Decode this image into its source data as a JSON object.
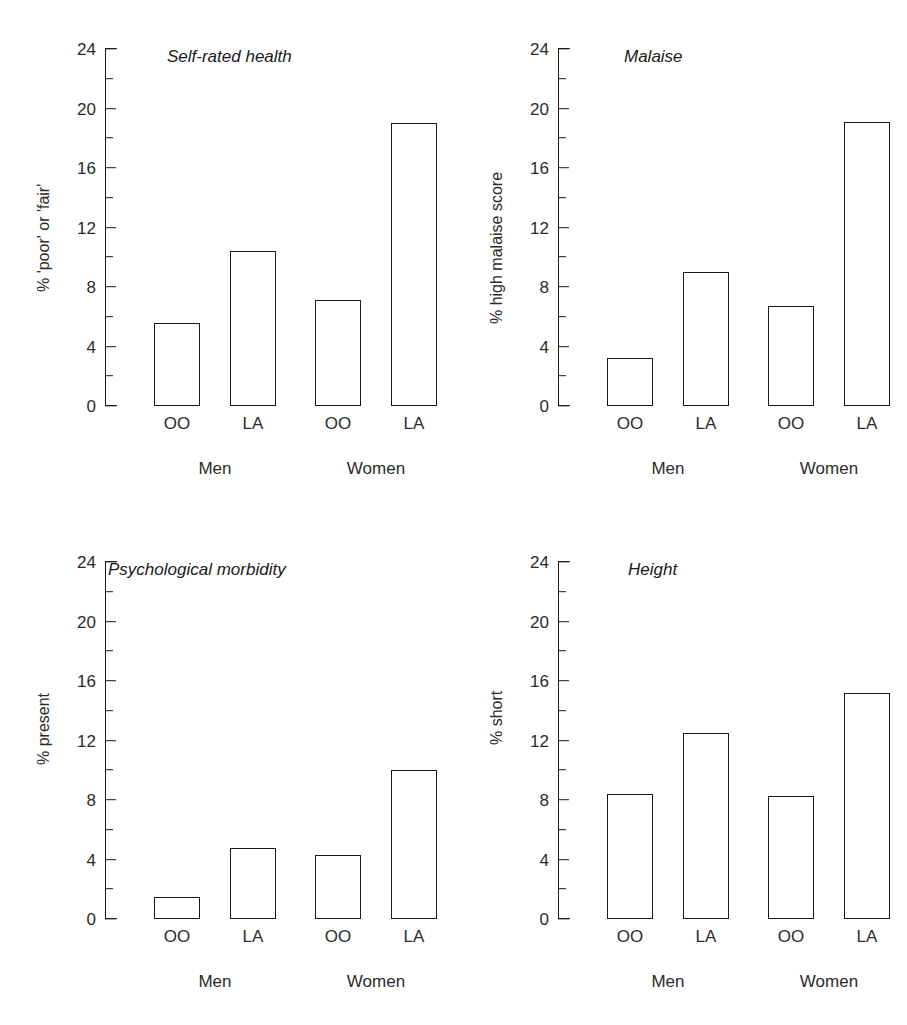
{
  "chart_data": [
    {
      "type": "bar",
      "title": "Self-rated health",
      "ylabel": "% 'poor' or 'fair'",
      "xlabel": "",
      "ylim": [
        0,
        24
      ],
      "yticks": [
        0,
        4,
        8,
        12,
        16,
        20,
        24
      ],
      "ytick_labels": [
        "0",
        "4",
        "8",
        "12",
        "16",
        "20",
        "24"
      ],
      "yticks_minor": [
        2,
        6,
        10,
        14,
        18,
        22
      ],
      "grid": false,
      "legend": "none",
      "groups": [
        "Men",
        "Women"
      ],
      "categories": [
        "OO",
        "LA"
      ],
      "bars": [
        {
          "group": "Men",
          "category": "OO",
          "value": 5.6
        },
        {
          "group": "Men",
          "category": "LA",
          "value": 10.4
        },
        {
          "group": "Women",
          "category": "OO",
          "value": 7.1
        },
        {
          "group": "Women",
          "category": "LA",
          "value": 19.0
        }
      ]
    },
    {
      "type": "bar",
      "title": "Malaise",
      "ylabel": "% high malaise score",
      "xlabel": "",
      "ylim": [
        0,
        24
      ],
      "yticks": [
        0,
        4,
        8,
        12,
        16,
        20,
        24
      ],
      "ytick_labels": [
        "0",
        "4",
        "8",
        "12",
        "16",
        "20",
        "24"
      ],
      "yticks_minor": [
        2,
        6,
        10,
        14,
        18,
        22
      ],
      "grid": false,
      "legend": "none",
      "groups": [
        "Men",
        "Women"
      ],
      "categories": [
        "OO",
        "LA"
      ],
      "bars": [
        {
          "group": "Men",
          "category": "OO",
          "value": 3.2
        },
        {
          "group": "Men",
          "category": "LA",
          "value": 9.0
        },
        {
          "group": "Women",
          "category": "OO",
          "value": 6.7
        },
        {
          "group": "Women",
          "category": "LA",
          "value": 19.1
        }
      ]
    },
    {
      "type": "bar",
      "title": "Psychological morbidity",
      "ylabel": "% present",
      "xlabel": "",
      "ylim": [
        0,
        24
      ],
      "yticks": [
        0,
        4,
        8,
        12,
        16,
        20,
        24
      ],
      "ytick_labels": [
        "0",
        "4",
        "8",
        "12",
        "16",
        "20",
        "24"
      ],
      "yticks_minor": [
        2,
        6,
        10,
        14,
        18,
        22
      ],
      "grid": false,
      "legend": "none",
      "groups": [
        "Men",
        "Women"
      ],
      "categories": [
        "OO",
        "LA"
      ],
      "bars": [
        {
          "group": "Men",
          "category": "OO",
          "value": 1.5
        },
        {
          "group": "Men",
          "category": "LA",
          "value": 4.8
        },
        {
          "group": "Women",
          "category": "OO",
          "value": 4.3
        },
        {
          "group": "Women",
          "category": "LA",
          "value": 10.0
        }
      ]
    },
    {
      "type": "bar",
      "title": "Height",
      "ylabel": "% short",
      "xlabel": "",
      "ylim": [
        0,
        24
      ],
      "yticks": [
        0,
        4,
        8,
        12,
        16,
        20,
        24
      ],
      "ytick_labels": [
        "0",
        "4",
        "8",
        "12",
        "16",
        "20",
        "24"
      ],
      "yticks_minor": [
        2,
        6,
        10,
        14,
        18,
        22
      ],
      "grid": false,
      "legend": "none",
      "groups": [
        "Men",
        "Women"
      ],
      "categories": [
        "OO",
        "LA"
      ],
      "bars": [
        {
          "group": "Men",
          "category": "OO",
          "value": 8.4
        },
        {
          "group": "Men",
          "category": "LA",
          "value": 12.5
        },
        {
          "group": "Women",
          "category": "OO",
          "value": 8.3
        },
        {
          "group": "Women",
          "category": "LA",
          "value": 15.2
        }
      ]
    }
  ],
  "layout": {
    "panel_title_left_offsets": [
      167,
      171,
      108,
      175
    ],
    "ylabel_top_offsets": [
      292,
      324,
      252,
      232
    ],
    "bar_centers": [
      72,
      148,
      233,
      309
    ],
    "group_centers": [
      110,
      271
    ],
    "bar_width": 46
  }
}
